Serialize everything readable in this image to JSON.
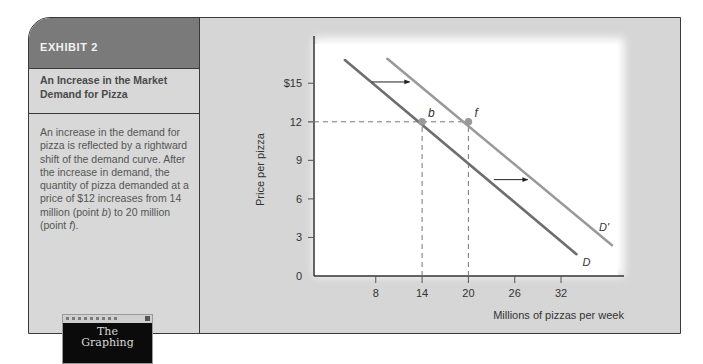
{
  "exhibit": {
    "label": "EXHIBIT 2",
    "title": "An Increase in the Market Demand for Pizza",
    "caption_parts": [
      "An increase in the demand for pizza is reflected by a rightward shift of the demand curve. After the increase in demand, the quantity of pizza demanded at a price of $12 increases from 14 million (point ",
      "b",
      ") to 20 million (point ",
      "f",
      ")."
    ]
  },
  "cover": {
    "line1": "The",
    "line2": "Graphing"
  },
  "chart_data": {
    "type": "line",
    "title": "An Increase in the Market Demand for Pizza",
    "xlabel": "Millions of pizzas per week",
    "ylabel": "Price per pizza",
    "xlim": [
      0,
      40
    ],
    "ylim": [
      0,
      18
    ],
    "x_ticks": [
      8,
      14,
      20,
      26,
      32
    ],
    "x_tick_labels": [
      "8",
      "14",
      "20",
      "26",
      "32"
    ],
    "y_ticks": [
      0,
      3,
      6,
      9,
      12,
      15
    ],
    "y_tick_labels": [
      "0",
      "3",
      "6",
      "9",
      "12",
      "$15"
    ],
    "grid": false,
    "series": [
      {
        "name": "D",
        "label": "D",
        "color": "#6e6e6e",
        "points": [
          [
            4,
            16.8
          ],
          [
            34,
            1.7
          ]
        ]
      },
      {
        "name": "D'",
        "label": "D'",
        "color": "#9a9a9a",
        "points": [
          [
            9.5,
            16.9
          ],
          [
            38.6,
            2.4
          ]
        ]
      }
    ],
    "points": [
      {
        "label": "b",
        "x": 14,
        "y": 12
      },
      {
        "label": "f",
        "x": 20,
        "y": 12
      }
    ],
    "annotations": [
      {
        "type": "arrow",
        "from": [
          7.5,
          15.1
        ],
        "to": [
          12.4,
          15.1
        ],
        "meaning": "rightward shift"
      },
      {
        "type": "arrow",
        "from": [
          23.3,
          7.5
        ],
        "to": [
          27.7,
          7.5
        ],
        "meaning": "rightward shift"
      },
      {
        "type": "dashed-line",
        "from": [
          0,
          12
        ],
        "to": [
          20,
          12
        ]
      },
      {
        "type": "dashed-line",
        "from": [
          14,
          0
        ],
        "to": [
          14,
          12
        ]
      },
      {
        "type": "dashed-line",
        "from": [
          20,
          0
        ],
        "to": [
          20,
          12
        ]
      }
    ]
  }
}
